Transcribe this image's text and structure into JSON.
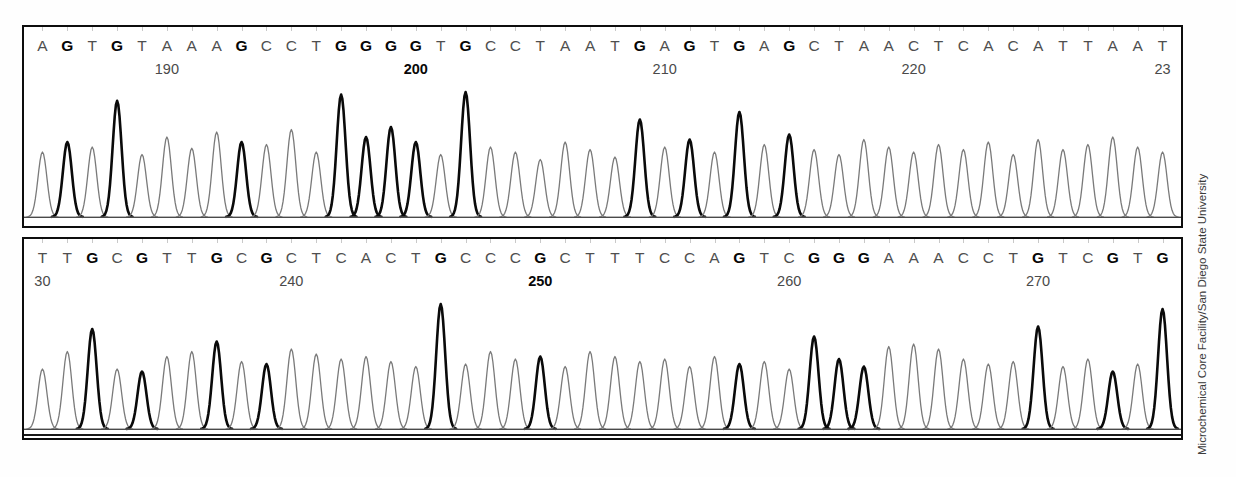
{
  "figure": {
    "credit": "Microchemical Core Facility/San Diego State University",
    "colors": {
      "frame": "#0d0d0d",
      "background": "#ffffff",
      "trace_light": "#7a7a7a",
      "trace_bold": "#0a0a0a",
      "text": "#4f4f4f",
      "text_bold": "#060606"
    }
  },
  "chart_data": {
    "type": "line",
    "xlabel": "Base position",
    "ylabel": "Signal intensity",
    "grid": false,
    "legend": null,
    "panels": [
      {
        "name": "panel-1",
        "sequence": "AGTGTAAAGCCTGGGGTGCCTAATGAGTGAGCTAACTCACATTAAT",
        "start_position": 185,
        "bases": [
          {
            "base": "A",
            "bold": false,
            "height": 0.52
          },
          {
            "base": "G",
            "bold": true,
            "height": 0.6
          },
          {
            "base": "T",
            "bold": false,
            "height": 0.56
          },
          {
            "base": "G",
            "bold": true,
            "height": 0.93
          },
          {
            "base": "T",
            "bold": false,
            "height": 0.5
          },
          {
            "base": "A",
            "bold": false,
            "height": 0.64
          },
          {
            "base": "A",
            "bold": false,
            "height": 0.55
          },
          {
            "base": "A",
            "bold": false,
            "height": 0.68
          },
          {
            "base": "G",
            "bold": true,
            "height": 0.6
          },
          {
            "base": "C",
            "bold": false,
            "height": 0.58
          },
          {
            "base": "C",
            "bold": false,
            "height": 0.7
          },
          {
            "base": "T",
            "bold": false,
            "height": 0.52
          },
          {
            "base": "G",
            "bold": true,
            "height": 0.98
          },
          {
            "base": "G",
            "bold": true,
            "height": 0.64
          },
          {
            "base": "G",
            "bold": true,
            "height": 0.72
          },
          {
            "base": "G",
            "bold": true,
            "height": 0.6
          },
          {
            "base": "T",
            "bold": false,
            "height": 0.5
          },
          {
            "base": "G",
            "bold": true,
            "height": 1.0
          },
          {
            "base": "C",
            "bold": false,
            "height": 0.56
          },
          {
            "base": "C",
            "bold": false,
            "height": 0.52
          },
          {
            "base": "T",
            "bold": false,
            "height": 0.46
          },
          {
            "base": "A",
            "bold": false,
            "height": 0.6
          },
          {
            "base": "A",
            "bold": false,
            "height": 0.54
          },
          {
            "base": "T",
            "bold": false,
            "height": 0.48
          },
          {
            "base": "G",
            "bold": true,
            "height": 0.78
          },
          {
            "base": "A",
            "bold": false,
            "height": 0.56
          },
          {
            "base": "G",
            "bold": true,
            "height": 0.62
          },
          {
            "base": "T",
            "bold": false,
            "height": 0.52
          },
          {
            "base": "G",
            "bold": true,
            "height": 0.84
          },
          {
            "base": "A",
            "bold": false,
            "height": 0.58
          },
          {
            "base": "G",
            "bold": true,
            "height": 0.66
          },
          {
            "base": "C",
            "bold": false,
            "height": 0.54
          },
          {
            "base": "T",
            "bold": false,
            "height": 0.5
          },
          {
            "base": "A",
            "bold": false,
            "height": 0.62
          },
          {
            "base": "A",
            "bold": false,
            "height": 0.56
          },
          {
            "base": "C",
            "bold": false,
            "height": 0.52
          },
          {
            "base": "T",
            "bold": false,
            "height": 0.58
          },
          {
            "base": "C",
            "bold": false,
            "height": 0.54
          },
          {
            "base": "A",
            "bold": false,
            "height": 0.6
          },
          {
            "base": "C",
            "bold": false,
            "height": 0.5
          },
          {
            "base": "A",
            "bold": false,
            "height": 0.62
          },
          {
            "base": "T",
            "bold": false,
            "height": 0.54
          },
          {
            "base": "T",
            "bold": false,
            "height": 0.58
          },
          {
            "base": "A",
            "bold": false,
            "height": 0.64
          },
          {
            "base": "A",
            "bold": false,
            "height": 0.56
          },
          {
            "base": "T",
            "bold": false,
            "height": 0.52
          }
        ],
        "position_labels": [
          {
            "text": "190",
            "base_index": 5,
            "bold": false
          },
          {
            "text": "200",
            "base_index": 15,
            "bold": true
          },
          {
            "text": "210",
            "base_index": 25,
            "bold": false
          },
          {
            "text": "220",
            "base_index": 35,
            "bold": false
          },
          {
            "text": "23",
            "base_index": 45,
            "bold": false
          }
        ]
      },
      {
        "name": "panel-2",
        "sequence": "TTGCGTTGCGCTCACTGCCCGCTTTCCAGTCGGGAAACCTGTCGTG",
        "start_position": 229,
        "bases": [
          {
            "base": "T",
            "bold": false,
            "height": 0.48
          },
          {
            "base": "T",
            "bold": false,
            "height": 0.62
          },
          {
            "base": "G",
            "bold": true,
            "height": 0.8
          },
          {
            "base": "C",
            "bold": false,
            "height": 0.48
          },
          {
            "base": "G",
            "bold": true,
            "height": 0.46
          },
          {
            "base": "T",
            "bold": false,
            "height": 0.58
          },
          {
            "base": "T",
            "bold": false,
            "height": 0.62
          },
          {
            "base": "G",
            "bold": true,
            "height": 0.7
          },
          {
            "base": "C",
            "bold": false,
            "height": 0.54
          },
          {
            "base": "G",
            "bold": true,
            "height": 0.52
          },
          {
            "base": "C",
            "bold": false,
            "height": 0.64
          },
          {
            "base": "T",
            "bold": false,
            "height": 0.6
          },
          {
            "base": "C",
            "bold": false,
            "height": 0.56
          },
          {
            "base": "A",
            "bold": false,
            "height": 0.58
          },
          {
            "base": "C",
            "bold": false,
            "height": 0.54
          },
          {
            "base": "T",
            "bold": false,
            "height": 0.5
          },
          {
            "base": "G",
            "bold": true,
            "height": 1.0
          },
          {
            "base": "C",
            "bold": false,
            "height": 0.52
          },
          {
            "base": "C",
            "bold": false,
            "height": 0.62
          },
          {
            "base": "C",
            "bold": false,
            "height": 0.56
          },
          {
            "base": "G",
            "bold": true,
            "height": 0.58
          },
          {
            "base": "C",
            "bold": false,
            "height": 0.5
          },
          {
            "base": "T",
            "bold": false,
            "height": 0.62
          },
          {
            "base": "T",
            "bold": false,
            "height": 0.58
          },
          {
            "base": "T",
            "bold": false,
            "height": 0.54
          },
          {
            "base": "C",
            "bold": false,
            "height": 0.56
          },
          {
            "base": "C",
            "bold": false,
            "height": 0.5
          },
          {
            "base": "A",
            "bold": false,
            "height": 0.58
          },
          {
            "base": "G",
            "bold": true,
            "height": 0.52
          },
          {
            "base": "T",
            "bold": false,
            "height": 0.54
          },
          {
            "base": "C",
            "bold": false,
            "height": 0.48
          },
          {
            "base": "G",
            "bold": true,
            "height": 0.74
          },
          {
            "base": "G",
            "bold": true,
            "height": 0.56
          },
          {
            "base": "G",
            "bold": true,
            "height": 0.5
          },
          {
            "base": "A",
            "bold": false,
            "height": 0.66
          },
          {
            "base": "A",
            "bold": false,
            "height": 0.68
          },
          {
            "base": "A",
            "bold": false,
            "height": 0.64
          },
          {
            "base": "C",
            "bold": false,
            "height": 0.56
          },
          {
            "base": "C",
            "bold": false,
            "height": 0.52
          },
          {
            "base": "T",
            "bold": false,
            "height": 0.54
          },
          {
            "base": "G",
            "bold": true,
            "height": 0.82
          },
          {
            "base": "T",
            "bold": false,
            "height": 0.5
          },
          {
            "base": "C",
            "bold": false,
            "height": 0.56
          },
          {
            "base": "G",
            "bold": true,
            "height": 0.46
          },
          {
            "base": "T",
            "bold": false,
            "height": 0.52
          },
          {
            "base": "G",
            "bold": true,
            "height": 0.96
          }
        ],
        "position_labels": [
          {
            "text": "30",
            "base_index": 0,
            "bold": false
          },
          {
            "text": "240",
            "base_index": 10,
            "bold": false
          },
          {
            "text": "250",
            "base_index": 20,
            "bold": true
          },
          {
            "text": "260",
            "base_index": 30,
            "bold": false
          },
          {
            "text": "270",
            "base_index": 40,
            "bold": false
          }
        ]
      }
    ]
  }
}
